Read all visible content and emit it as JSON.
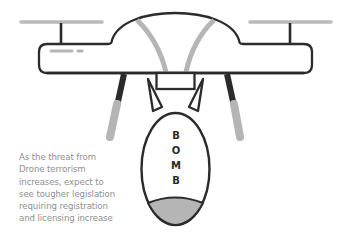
{
  "illustration": {
    "subject": "drone carrying bomb",
    "bomb_label": [
      "B",
      "O",
      "M",
      "B"
    ],
    "colors": {
      "outline": "#2b2b2b",
      "grey_accent": "#b5b5b5",
      "text": "#8f8f8f",
      "background": "#ffffff"
    }
  },
  "caption": {
    "lines": [
      "As the threat from",
      "Drone terrorism",
      "increases, expect to",
      "see tougher legislation",
      "requiring registration",
      "and licensing increase"
    ]
  }
}
